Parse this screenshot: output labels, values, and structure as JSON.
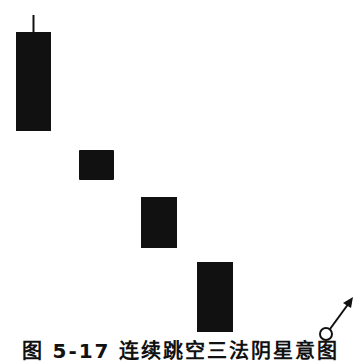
{
  "figure": {
    "caption": "图 5-17  连续跳空三法阴星意图",
    "colors": {
      "candle": "#111111",
      "background": "#ffffff",
      "symbol": "#111111"
    }
  },
  "candles": [
    {
      "type": "bearish",
      "x": 16,
      "width": 35,
      "body_top": 32,
      "body_bottom": 131,
      "wick_top": 15
    },
    {
      "type": "bearish",
      "x": 79,
      "width": 35,
      "body_top": 150,
      "body_bottom": 180
    },
    {
      "type": "bearish",
      "x": 141,
      "width": 36,
      "body_top": 197,
      "body_bottom": 248
    },
    {
      "type": "bearish",
      "x": 197,
      "width": 36,
      "body_top": 262,
      "body_bottom": 332
    }
  ],
  "signal": {
    "icon": "reversal-up-arrow-icon",
    "meaning": "upward reversal"
  }
}
